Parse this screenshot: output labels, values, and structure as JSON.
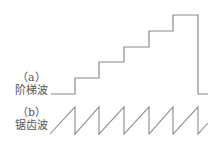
{
  "panels": [
    {
      "tag": "（a）",
      "name": "阶梯波"
    },
    {
      "tag": "（b）",
      "name": "锯齿波"
    }
  ],
  "colors": {
    "line": "#8a8a8a",
    "text": "#555555"
  }
}
